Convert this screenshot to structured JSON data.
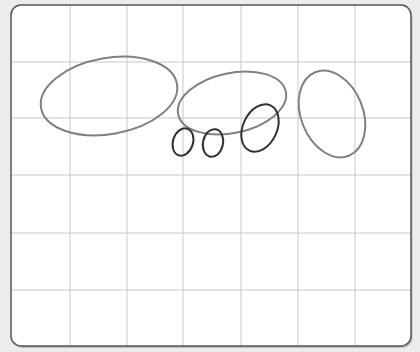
{
  "canvas": {
    "width": 420,
    "height": 352,
    "background": "#ececec"
  },
  "board": {
    "x": 11,
    "y": 5,
    "width": 400,
    "height": 341,
    "radius": 10,
    "fill": "#ffffff",
    "stroke": "#555555"
  },
  "grid": {
    "color": "#c8c8c8",
    "vertical": [
      70,
      127,
      183,
      241,
      298,
      355
    ],
    "horizontal": [
      62,
      118,
      175,
      233,
      290
    ]
  },
  "shapes": [
    {
      "name": "large-ellipse-left",
      "cx": 109,
      "cy": 96,
      "rx": 69,
      "ry": 38,
      "rotate": -10,
      "stroke": "#808080",
      "width": 2
    },
    {
      "name": "large-ellipse-center",
      "cx": 232,
      "cy": 103,
      "rx": 55,
      "ry": 30,
      "rotate": -12,
      "stroke": "#808080",
      "width": 2
    },
    {
      "name": "tall-ellipse-right",
      "cx": 332,
      "cy": 114,
      "rx": 31,
      "ry": 45,
      "rotate": -22,
      "stroke": "#808080",
      "width": 2
    },
    {
      "name": "small-ellipse-1",
      "cx": 183,
      "cy": 142,
      "rx": 10,
      "ry": 14,
      "rotate": 18,
      "stroke": "#333333",
      "width": 2
    },
    {
      "name": "small-ellipse-2",
      "cx": 213,
      "cy": 143,
      "rx": 10,
      "ry": 14,
      "rotate": 12,
      "stroke": "#333333",
      "width": 2
    },
    {
      "name": "medium-ellipse",
      "cx": 260,
      "cy": 128,
      "rx": 17,
      "ry": 25,
      "rotate": 25,
      "stroke": "#333333",
      "width": 2
    }
  ]
}
